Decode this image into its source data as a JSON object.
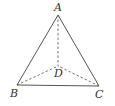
{
  "diagram": {
    "type": "tetrahedron",
    "vertices": {
      "A": {
        "label": "A",
        "x": 58,
        "y": 15
      },
      "B": {
        "label": "B",
        "x": 17,
        "y": 85
      },
      "C": {
        "label": "C",
        "x": 99,
        "y": 86
      },
      "D": {
        "label": "D",
        "x": 58,
        "y": 66
      }
    },
    "solid_edges": [
      "AB",
      "AC",
      "BC"
    ],
    "dashed_edges": [
      "AD",
      "BD",
      "CD"
    ],
    "colors": {
      "line": "#555555",
      "label": "#333333",
      "background": "#ffffff"
    }
  }
}
